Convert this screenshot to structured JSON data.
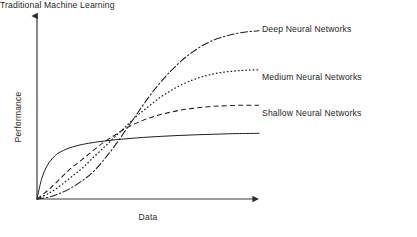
{
  "chart_data": {
    "type": "line",
    "title": "",
    "xlabel": "Data",
    "ylabel": "Performance",
    "xlim": [
      0,
      1
    ],
    "ylim": [
      0,
      1
    ],
    "grid": false,
    "axes_style": "arrow-axes",
    "legend_position": "right-inline-labels",
    "series": [
      {
        "name": "Deep Neural Networks",
        "linestyle": "dashdot",
        "color": "#1f1f1f",
        "x": [
          0.0,
          0.05,
          0.1,
          0.15,
          0.2,
          0.25,
          0.3,
          0.35,
          0.4,
          0.45,
          0.5,
          0.55,
          0.6,
          0.65,
          0.7,
          0.75,
          0.8,
          0.85,
          0.9,
          0.95,
          1.0
        ],
        "y": [
          0.0,
          0.01,
          0.03,
          0.06,
          0.1,
          0.15,
          0.22,
          0.3,
          0.39,
          0.48,
          0.57,
          0.65,
          0.72,
          0.78,
          0.83,
          0.87,
          0.9,
          0.92,
          0.935,
          0.945,
          0.95
        ]
      },
      {
        "name": "Medium Neural Networks",
        "linestyle": "dotted",
        "color": "#1f1f1f",
        "x": [
          0.0,
          0.05,
          0.1,
          0.15,
          0.2,
          0.25,
          0.3,
          0.35,
          0.4,
          0.45,
          0.5,
          0.55,
          0.6,
          0.65,
          0.7,
          0.75,
          0.8,
          0.85,
          0.9,
          0.95,
          1.0
        ],
        "y": [
          0.0,
          0.03,
          0.07,
          0.12,
          0.17,
          0.23,
          0.29,
          0.35,
          0.41,
          0.47,
          0.52,
          0.57,
          0.61,
          0.645,
          0.672,
          0.693,
          0.708,
          0.718,
          0.724,
          0.728,
          0.73
        ]
      },
      {
        "name": "Shallow Neural Networks",
        "linestyle": "dashed",
        "color": "#1f1f1f",
        "x": [
          0.0,
          0.05,
          0.1,
          0.15,
          0.2,
          0.25,
          0.3,
          0.35,
          0.4,
          0.45,
          0.5,
          0.55,
          0.6,
          0.65,
          0.7,
          0.75,
          0.8,
          0.85,
          0.9,
          0.95,
          1.0
        ],
        "y": [
          0.0,
          0.05,
          0.11,
          0.17,
          0.22,
          0.27,
          0.32,
          0.36,
          0.4,
          0.43,
          0.455,
          0.475,
          0.49,
          0.503,
          0.512,
          0.519,
          0.524,
          0.527,
          0.529,
          0.53,
          0.53
        ]
      },
      {
        "name": "Traditional Machine Learning",
        "linestyle": "solid",
        "color": "#1f1f1f",
        "x": [
          0.0,
          0.02,
          0.04,
          0.06,
          0.08,
          0.1,
          0.14,
          0.18,
          0.22,
          0.28,
          0.34,
          0.4,
          0.48,
          0.56,
          0.64,
          0.72,
          0.8,
          0.88,
          0.94,
          1.0
        ],
        "y": [
          0.0,
          0.11,
          0.175,
          0.215,
          0.243,
          0.262,
          0.286,
          0.301,
          0.312,
          0.324,
          0.333,
          0.34,
          0.348,
          0.354,
          0.359,
          0.363,
          0.366,
          0.369,
          0.37,
          0.371
        ]
      }
    ]
  },
  "axes": {
    "ylabel": "Performance",
    "xlabel": "Data"
  },
  "labels": {
    "deep": "Deep Neural Networks",
    "medium": "Medium Neural Networks",
    "shallow": "Shallow Neural Networks",
    "traditional": "Traditional Machine Learning"
  },
  "colors": {
    "ink": "#1f1f1f",
    "axis": "#3a3a3a",
    "background": "#ffffff"
  }
}
